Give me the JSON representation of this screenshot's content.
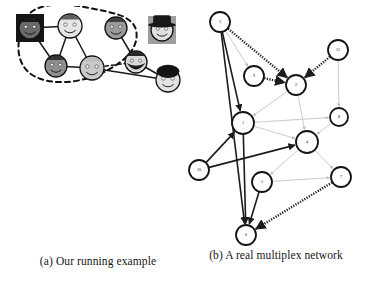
{
  "figure": {
    "background": "#ffffff",
    "ink": "#1a1a1a"
  },
  "panels": [
    {
      "id": "a",
      "caption": "(a) Our running example",
      "kind": "illustration-graph",
      "description": "Social network of cartoon face avatars linked by solid lines, with a dashed closed curve enclosing a community of five faces",
      "community_outline": {
        "style": "dashed",
        "color": "#111111"
      },
      "nodes": [
        {
          "id": "n1",
          "name": "dark-square-face",
          "x": 22,
          "y": 22,
          "r": 11,
          "skin": "#6a6a6a",
          "hair": "#161616",
          "backdrop": "#161616",
          "backdrop_shape": "square",
          "in_community": true
        },
        {
          "id": "n2",
          "name": "light-face-top",
          "x": 62,
          "y": 20,
          "r": 12,
          "skin": "#e6e6e6",
          "hair": "#5a5a5a",
          "backdrop": "none",
          "backdrop_shape": "none",
          "in_community": true
        },
        {
          "id": "n3",
          "name": "gray-face-top-right",
          "x": 108,
          "y": 22,
          "r": 11,
          "skin": "#9a9a9a",
          "hair": "#3a3a3a",
          "backdrop": "none",
          "backdrop_shape": "none",
          "in_community": true
        },
        {
          "id": "n4",
          "name": "gray-face-bottom-left",
          "x": 48,
          "y": 60,
          "r": 11,
          "skin": "#8e8e8e",
          "hair": "#2f2f2f",
          "backdrop": "none",
          "backdrop_shape": "none",
          "in_community": true
        },
        {
          "id": "n5",
          "name": "light-face-bottom",
          "x": 84,
          "y": 62,
          "r": 12,
          "skin": "#c9c9c9",
          "hair": "#bdbdbd",
          "backdrop": "none",
          "backdrop_shape": "none",
          "in_community": true
        },
        {
          "id": "n6",
          "name": "bearded-face",
          "x": 128,
          "y": 56,
          "r": 11,
          "skin": "#d8d8d8",
          "hair": "#1d1d1d",
          "backdrop": "none",
          "backdrop_shape": "none",
          "in_community": false
        },
        {
          "id": "n7",
          "name": "curly-hair-face",
          "x": 160,
          "y": 74,
          "r": 12,
          "skin": "#e2e2e2",
          "hair": "#141414",
          "backdrop": "none",
          "backdrop_shape": "none",
          "in_community": false
        },
        {
          "id": "n8",
          "name": "hat-face-isolated",
          "x": 154,
          "y": 24,
          "r": 11,
          "skin": "#e0e0e0",
          "hair": "#181818",
          "backdrop": "#9e9e9e",
          "backdrop_shape": "square",
          "in_community": false
        }
      ],
      "edges": [
        {
          "source": "n1",
          "target": "n2",
          "style": "solid"
        },
        {
          "source": "n1",
          "target": "n4",
          "style": "solid"
        },
        {
          "source": "n2",
          "target": "n4",
          "style": "solid"
        },
        {
          "source": "n2",
          "target": "n5",
          "style": "solid"
        },
        {
          "source": "n3",
          "target": "n6",
          "style": "solid"
        },
        {
          "source": "n4",
          "target": "n5",
          "style": "solid"
        },
        {
          "source": "n5",
          "target": "n6",
          "style": "dashed"
        },
        {
          "source": "n5",
          "target": "n7",
          "style": "solid"
        },
        {
          "source": "n6",
          "target": "n7",
          "style": "solid"
        }
      ]
    },
    {
      "id": "b",
      "caption": "(b) A real multiplex network",
      "kind": "multiplex-network",
      "description": "Circular numbered nodes connected by multiple edge layers: solid black arrows, dashed/hatched black arrows and faint gray arrows",
      "nodes": [
        {
          "id": "3",
          "label": "3",
          "x": 34,
          "y": 22,
          "r": 10
        },
        {
          "id": "11",
          "label": "11",
          "x": 152,
          "y": 50,
          "r": 10
        },
        {
          "id": "9",
          "label": "9",
          "x": 68,
          "y": 76,
          "r": 10
        },
        {
          "id": "2",
          "label": "2",
          "x": 110,
          "y": 85,
          "r": 10
        },
        {
          "id": "1",
          "label": "1",
          "x": 57,
          "y": 123,
          "r": 11
        },
        {
          "id": "8",
          "label": "8",
          "x": 153,
          "y": 117,
          "r": 9
        },
        {
          "id": "4",
          "label": "4",
          "x": 121,
          "y": 142,
          "r": 11
        },
        {
          "id": "10",
          "label": "10",
          "x": 13,
          "y": 170,
          "r": 10
        },
        {
          "id": "5",
          "label": "5",
          "x": 76,
          "y": 182,
          "r": 10
        },
        {
          "id": "7",
          "label": "7",
          "x": 155,
          "y": 177,
          "r": 10
        },
        {
          "id": "6",
          "label": "6",
          "x": 60,
          "y": 235,
          "r": 10
        }
      ],
      "layers": [
        {
          "name": "layer-solid-black",
          "style": "solid",
          "color": "#1c1c1c"
        },
        {
          "name": "layer-hatched-black",
          "style": "hatched",
          "color": "#1c1c1c"
        },
        {
          "name": "layer-faint-gray",
          "style": "faint",
          "color": "#b8b8b8"
        }
      ],
      "edges": [
        {
          "source": "3",
          "target": "2",
          "layer": "layer-hatched-black",
          "directed": true
        },
        {
          "source": "3",
          "target": "9",
          "layer": "layer-faint-gray",
          "directed": true
        },
        {
          "source": "3",
          "target": "1",
          "layer": "layer-solid-black",
          "directed": true
        },
        {
          "source": "3",
          "target": "6",
          "layer": "layer-solid-black",
          "directed": true
        },
        {
          "source": "9",
          "target": "2",
          "layer": "layer-hatched-black",
          "directed": true
        },
        {
          "source": "11",
          "target": "2",
          "layer": "layer-hatched-black",
          "directed": true
        },
        {
          "source": "2",
          "target": "1",
          "layer": "layer-faint-gray",
          "directed": true
        },
        {
          "source": "2",
          "target": "4",
          "layer": "layer-faint-gray",
          "directed": true
        },
        {
          "source": "1",
          "target": "8",
          "layer": "layer-faint-gray",
          "directed": true
        },
        {
          "source": "1",
          "target": "4",
          "layer": "layer-faint-gray",
          "directed": true
        },
        {
          "source": "10",
          "target": "1",
          "layer": "layer-solid-black",
          "directed": true
        },
        {
          "source": "10",
          "target": "4",
          "layer": "layer-solid-black",
          "directed": true
        },
        {
          "source": "8",
          "target": "4",
          "layer": "layer-faint-gray",
          "directed": true
        },
        {
          "source": "4",
          "target": "7",
          "layer": "layer-faint-gray",
          "directed": true
        },
        {
          "source": "4",
          "target": "5",
          "layer": "layer-faint-gray",
          "directed": true
        },
        {
          "source": "5",
          "target": "7",
          "layer": "layer-faint-gray",
          "directed": true
        },
        {
          "source": "5",
          "target": "6",
          "layer": "layer-solid-black",
          "directed": true
        },
        {
          "source": "7",
          "target": "6",
          "layer": "layer-hatched-black",
          "directed": true
        },
        {
          "source": "1",
          "target": "6",
          "layer": "layer-solid-black",
          "directed": true
        },
        {
          "source": "11",
          "target": "8",
          "layer": "layer-faint-gray",
          "directed": true
        }
      ]
    }
  ]
}
